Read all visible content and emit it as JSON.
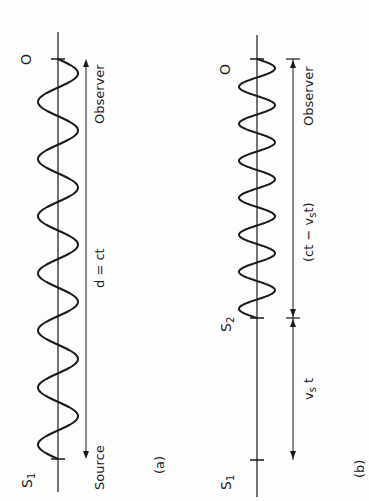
{
  "figure": {
    "panel_a": {
      "caption": "(a)",
      "source_label": "S",
      "source_sub": "1",
      "observer_symbol": "O",
      "observer_text": "Observer",
      "source_text": "Source",
      "distance_label": "d = ct",
      "wave_cycles": 7
    },
    "panel_b": {
      "caption": "(b)",
      "source1_label": "S",
      "source1_sub": "1",
      "source2_label": "S",
      "source2_sub": "2",
      "observer_symbol": "O",
      "observer_text": "Observer",
      "distance_label_1": "(ct − v",
      "distance_label_1_sub": "s",
      "distance_label_1_end": "t)",
      "distance_label_2": "v",
      "distance_label_2_sub": "s",
      "distance_label_2_end": " t",
      "wave_cycles": 7
    },
    "colors": {
      "ink": "#1a1a1a",
      "background": "#fdfdfd"
    }
  }
}
